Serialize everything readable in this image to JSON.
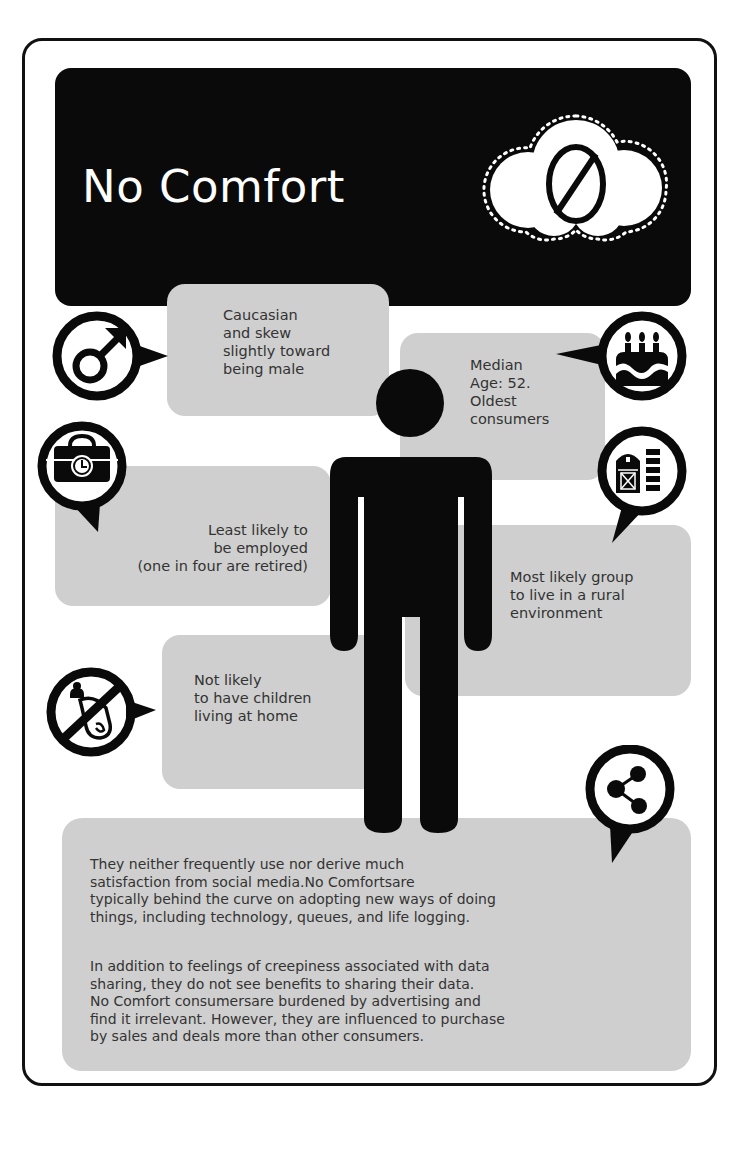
{
  "title": "No Comfort",
  "header_icon": "cloud-prohibited-icon",
  "facts": [
    {
      "id": "gender",
      "icon": "male-symbol-icon",
      "text": "Caucasian\nand skew\nslightly toward\nbeing male"
    },
    {
      "id": "age",
      "icon": "birthday-cake-icon",
      "text": "Median\nAge: 52.\nOldest\nconsumers"
    },
    {
      "id": "employment",
      "icon": "briefcase-clock-icon",
      "text": "Least likely to\nbe employed\n(one in four are retired)"
    },
    {
      "id": "location",
      "icon": "barn-silo-icon",
      "text": "Most likely group\nto live in a rural\nenvironment"
    },
    {
      "id": "children",
      "icon": "no-baby-bottle-icon",
      "text": "Not likely\nto have children\nliving at home"
    }
  ],
  "summary": {
    "icon": "share-icon",
    "paragraphs": [
      "They neither frequently use nor derive much\nsatisfaction from social media.No Comfortsare\ntypically behind the curve on adopting new ways of doing\nthings, including technology, queues, and life logging.",
      "In addition to feelings of creepiness associated with data\nsharing, they do not see benefits to sharing their data.\nNo Comfort consumersare burdened by advertising and\nfind it irrelevant. However, they are influenced to purchase\nby sales and deals more than other consumers."
    ]
  },
  "colors": {
    "banner": "#0a0a0a",
    "bubble": "#cfcfcf",
    "text": "#333333",
    "icon": "#111111"
  }
}
